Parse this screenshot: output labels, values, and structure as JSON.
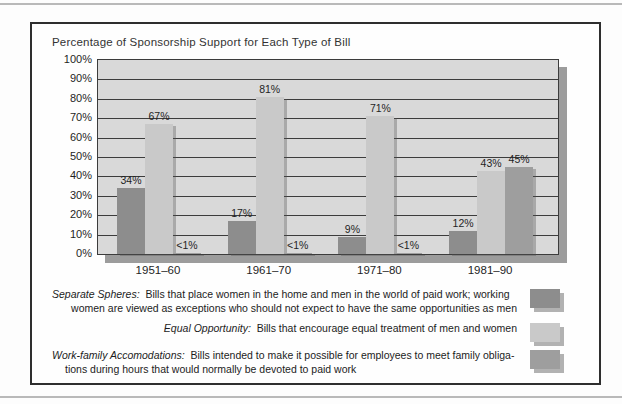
{
  "chart_data": {
    "type": "bar",
    "title": "Percentage of Sponsorship Support for Each Type of Bill",
    "categories": [
      "1951–60",
      "1961–70",
      "1971–80",
      "1981–90"
    ],
    "series": [
      {
        "name": "Separate Spheres",
        "color": "#8d8d8d",
        "values": [
          34,
          17,
          9,
          12
        ],
        "labels": [
          "34%",
          "17%",
          "9%",
          "12%"
        ]
      },
      {
        "name": "Equal Opportunity",
        "color": "#c9c9c9",
        "values": [
          67,
          81,
          71,
          43
        ],
        "labels": [
          "67%",
          "81%",
          "71%",
          "43%"
        ]
      },
      {
        "name": "Work-family Accomodations",
        "color": "#9e9e9e",
        "values": [
          0.7,
          0.7,
          0.7,
          45
        ],
        "labels": [
          "<1%",
          "<1%",
          "<1%",
          "45%"
        ]
      }
    ],
    "xlabel": "",
    "ylabel": "",
    "ylim": [
      0,
      100
    ],
    "ytick_step": 10,
    "ytick_labels": [
      "0%",
      "10%",
      "20%",
      "30%",
      "40%",
      "50%",
      "60%",
      "70%",
      "80%",
      "90%",
      "100%"
    ],
    "grid": "horizontal",
    "legend_position": "below"
  },
  "legend": [
    {
      "term": "Separate Spheres:",
      "line1": "Bills that place women in the home and men in the world of paid work;  working",
      "line2": "women are viewed as exceptions who should not expect to have the same opportunities as men"
    },
    {
      "term": "Equal Opportunity:",
      "line1": "Bills that encourage equal treatment of men and women",
      "line2": ""
    },
    {
      "term": "Work-family Accomodations:",
      "line1": "Bills intended to make it possible for employees to meet family obliga-",
      "line2": "tions during hours that would normally be devoted to paid work"
    }
  ],
  "colors": {
    "plot_bg": "#d9d9d9",
    "plot_shadow": "#9c9c9c",
    "gridline": "#3c3c3c",
    "frame_border": "#2e2e2e",
    "page_rule": "#b9b9b9",
    "swatch_shadow": "#b2b2b2"
  }
}
